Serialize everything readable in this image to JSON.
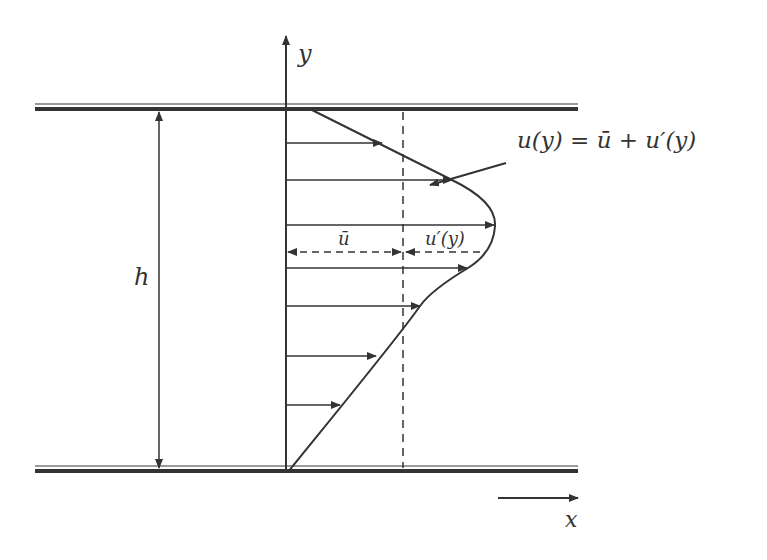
{
  "diagram": {
    "colors": {
      "line": "#333333",
      "wall_light": "#9a9a9a",
      "background": "#ffffff"
    },
    "labels": {
      "y_axis": "y",
      "x_axis": "x",
      "height": "h",
      "profile_equation": "u(y) = ū + u′(y)",
      "mean_velocity": "ū",
      "fluctuation": "u′(y)"
    },
    "walls": [
      {
        "name": "top-wall",
        "y": 108
      },
      {
        "name": "bottom-wall",
        "y": 470
      }
    ],
    "velocity_arrows": [
      {
        "y": 143,
        "x_end": 382
      },
      {
        "y": 180,
        "x_end": 452
      },
      {
        "y": 225,
        "x_end": 494
      },
      {
        "y": 268,
        "x_end": 467
      },
      {
        "y": 306,
        "x_end": 420
      },
      {
        "y": 356,
        "x_end": 376
      },
      {
        "y": 405,
        "x_end": 340
      }
    ]
  }
}
